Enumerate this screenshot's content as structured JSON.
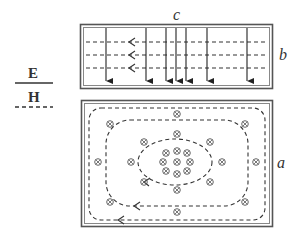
{
  "diagram": {
    "type": "electromagnetic-field-diagram",
    "legend": {
      "items": [
        {
          "symbol": "E",
          "line_style": "solid"
        },
        {
          "symbol": "H",
          "line_style": "dashed"
        }
      ]
    },
    "top_view": {
      "labels": {
        "top": "c",
        "right": "b"
      },
      "e_field_arrows_x": [
        106,
        146,
        166,
        176,
        186,
        207,
        247
      ],
      "h_field_lines_y": [
        42,
        55,
        68
      ],
      "h_direction": "left"
    },
    "bottom_view": {
      "labels": {
        "right": "a"
      },
      "into_page_symbol": "⊗",
      "center_cluster": [
        [
          166,
          153
        ],
        [
          177,
          151
        ],
        [
          187,
          153
        ],
        [
          163,
          162
        ],
        [
          177,
          162
        ],
        [
          190,
          162
        ],
        [
          166,
          171
        ],
        [
          177,
          174
        ],
        [
          187,
          171
        ]
      ],
      "middle_ring": [
        [
          177,
          134
        ],
        [
          144,
          142
        ],
        [
          210,
          142
        ],
        [
          131,
          162
        ],
        [
          222,
          162
        ],
        [
          144,
          182
        ],
        [
          210,
          182
        ],
        [
          177,
          190
        ]
      ],
      "outer_ring": [
        [
          177,
          114
        ],
        [
          110,
          124
        ],
        [
          245,
          124
        ],
        [
          98,
          162
        ],
        [
          256,
          162
        ],
        [
          110,
          202
        ],
        [
          245,
          202
        ],
        [
          177,
          212
        ]
      ],
      "h_loops": [
        "inner-ellipse",
        "middle-rounded-rect",
        "outer-rounded-rect"
      ]
    },
    "colors": {
      "line": "#222222",
      "frame": "#555555",
      "frame_inner": "#999999"
    }
  }
}
